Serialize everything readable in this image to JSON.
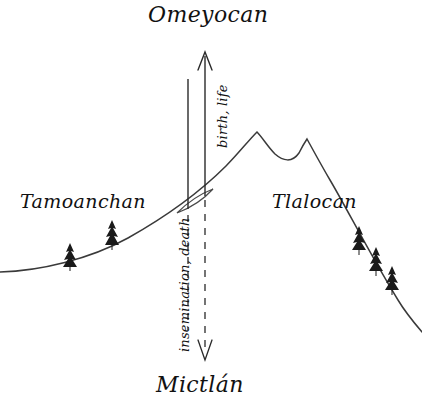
{
  "diagram": {
    "title_top": "Omeyocan",
    "title_bottom": "Mictlán",
    "region_left": "Tamoanchan",
    "region_right": "Tlalocan",
    "axis_up_label": "birth, life",
    "axis_down_label": "insemination, death",
    "colors": {
      "background": "#ffffff",
      "ink": "#111111",
      "line": "#3a3a3a",
      "tree": "#1a1a1a"
    },
    "elements": {
      "mountain_name": "sacred-mountain-outline",
      "portal_name": "lens-portal",
      "up_arrow_name": "ascending-axis-arrow",
      "down_arrow_name": "descending-axis-arrow",
      "trees_left_count": 2,
      "trees_right_count": 3
    }
  }
}
